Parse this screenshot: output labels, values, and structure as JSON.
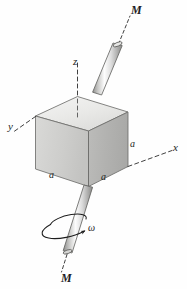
{
  "figure": {
    "background_color": "#fefefe",
    "line_color": "#1d1d1d",
    "labels": {
      "torque_top": "M",
      "torque_bottom": "M",
      "axis_x": "x",
      "axis_y": "y",
      "axis_z": "z",
      "edge_a_right": "a",
      "edge_a_front": "a",
      "edge_a_left": "a",
      "angular_velocity": "ω"
    },
    "cube": {
      "edge_length_symbol": "a",
      "face_top_color": "#ececeb",
      "face_left_color": "#cfcfcd",
      "face_right_color": "#b2b2b0",
      "edge_color": "#6f6f6d"
    },
    "shaft": {
      "body_color": "#c9c9c7",
      "highlight_color": "#fbfbfb",
      "edge_color": "#5e5e5c"
    },
    "axes": {
      "style": "dashed",
      "color": "#2a2a2a"
    }
  }
}
